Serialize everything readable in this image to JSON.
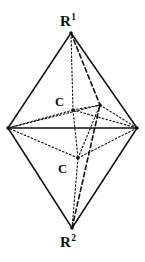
{
  "figure": {
    "type": "chemical-structure-diagram",
    "shape_name": "bipyramid",
    "background_color": "#ffffff",
    "line_color": "#111111"
  },
  "labels": {
    "apex_top": {
      "symbol": "R",
      "superscript": "1",
      "text": "R1"
    },
    "apex_bottom": {
      "symbol": "R",
      "superscript": "2",
      "text": "R2"
    },
    "carbon_upper": {
      "text": "C"
    },
    "carbon_lower": {
      "text": "C"
    }
  },
  "chart_data": {
    "type": "scatter",
    "title": "",
    "xlabel": "",
    "ylabel": "",
    "xlim": [
      0,
      145
    ],
    "ylim": [
      0,
      262
    ],
    "grid": false,
    "legend": "none",
    "vertices": [
      {
        "name": "apex_top",
        "label": "R1",
        "x": 71,
        "y": 33
      },
      {
        "name": "apex_bottom",
        "label": "R2",
        "x": 72,
        "y": 228
      },
      {
        "name": "equator_left",
        "label": "",
        "x": 8,
        "y": 128
      },
      {
        "name": "equator_right",
        "label": "",
        "x": 137,
        "y": 128
      },
      {
        "name": "carbon_upper",
        "label": "C",
        "x": 73,
        "y": 110
      },
      {
        "name": "carbon_lower",
        "label": "C",
        "x": 78,
        "y": 158
      },
      {
        "name": "equator_front",
        "label": "",
        "x": 100,
        "y": 105
      }
    ],
    "edges": [
      {
        "from": "apex_top",
        "to": "equator_left",
        "style": "solid"
      },
      {
        "from": "apex_top",
        "to": "equator_right",
        "style": "solid"
      },
      {
        "from": "apex_bottom",
        "to": "equator_left",
        "style": "solid"
      },
      {
        "from": "apex_bottom",
        "to": "equator_right",
        "style": "solid"
      },
      {
        "from": "equator_left",
        "to": "equator_right",
        "style": "solid"
      },
      {
        "from": "apex_top",
        "to": "carbon_upper",
        "style": "dotted"
      },
      {
        "from": "apex_top",
        "to": "equator_front",
        "style": "dashed"
      },
      {
        "from": "apex_bottom",
        "to": "carbon_lower",
        "style": "dotted"
      },
      {
        "from": "apex_bottom",
        "to": "equator_front",
        "style": "dashed"
      },
      {
        "from": "carbon_upper",
        "to": "equator_left",
        "style": "dotted"
      },
      {
        "from": "carbon_upper",
        "to": "equator_right",
        "style": "dotted"
      },
      {
        "from": "carbon_upper",
        "to": "equator_front",
        "style": "dotted"
      },
      {
        "from": "carbon_lower",
        "to": "equator_left",
        "style": "dotted"
      },
      {
        "from": "carbon_lower",
        "to": "equator_right",
        "style": "dotted"
      },
      {
        "from": "carbon_lower",
        "to": "equator_front",
        "style": "dotted"
      },
      {
        "from": "carbon_upper",
        "to": "carbon_lower",
        "style": "dotted"
      },
      {
        "from": "equator_left",
        "to": "equator_front",
        "style": "dotted"
      },
      {
        "from": "equator_right",
        "to": "equator_front",
        "style": "dotted"
      }
    ]
  }
}
